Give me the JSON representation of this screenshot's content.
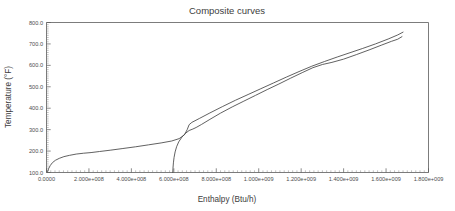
{
  "chart_data": {
    "type": "line",
    "title": "Composite curves",
    "xlabel": "Enthalpy (Btu/h)",
    "ylabel": "Temperature (°F)",
    "xlim": [
      0,
      1800000000
    ],
    "ylim": [
      100,
      800
    ],
    "grid": false,
    "legend": "none",
    "x_tick_labels": [
      "0.0000",
      "2.000e+008",
      "4.000e+008",
      "6.000e+008",
      "8.000e+008",
      "1.000e+009",
      "1.200e+009",
      "1.400e+009",
      "1.600e+009",
      "1.800e+009"
    ],
    "x_tick_values": [
      0,
      200000000,
      400000000,
      600000000,
      800000000,
      1000000000,
      1200000000,
      1400000000,
      1600000000,
      1800000000
    ],
    "y_tick_labels": [
      "100.0",
      "200.0",
      "300.0",
      "400.0",
      "500.0",
      "600.0",
      "700.0",
      "800.0"
    ],
    "y_tick_values": [
      100,
      200,
      300,
      400,
      500,
      600,
      700,
      800
    ],
    "x_minor_per_major": 10,
    "y_minor_per_major": 10,
    "series": [
      {
        "name": "hot composite curve",
        "color": "#444444",
        "points": [
          [
            5000000,
            103
          ],
          [
            10000000,
            118
          ],
          [
            18000000,
            133
          ],
          [
            28000000,
            146
          ],
          [
            42000000,
            157
          ],
          [
            60000000,
            166
          ],
          [
            82000000,
            174
          ],
          [
            108000000,
            180
          ],
          [
            140000000,
            186
          ],
          [
            175000000,
            190
          ],
          [
            210000000,
            193
          ],
          [
            250000000,
            198
          ],
          [
            300000000,
            204
          ],
          [
            360000000,
            212
          ],
          [
            420000000,
            220
          ],
          [
            480000000,
            229
          ],
          [
            540000000,
            238
          ],
          [
            590000000,
            247
          ],
          [
            625000000,
            258
          ],
          [
            650000000,
            276
          ],
          [
            663000000,
            300
          ],
          [
            672000000,
            323
          ],
          [
            685000000,
            334
          ],
          [
            720000000,
            352
          ],
          [
            770000000,
            378
          ],
          [
            830000000,
            408
          ],
          [
            890000000,
            437
          ],
          [
            950000000,
            464
          ],
          [
            1010000000,
            491
          ],
          [
            1070000000,
            518
          ],
          [
            1130000000,
            545
          ],
          [
            1190000000,
            571
          ],
          [
            1250000000,
            596
          ],
          [
            1310000000,
            618
          ],
          [
            1370000000,
            639
          ],
          [
            1430000000,
            659
          ],
          [
            1490000000,
            679
          ],
          [
            1550000000,
            700
          ],
          [
            1610000000,
            723
          ],
          [
            1655000000,
            742
          ],
          [
            1680000000,
            755
          ]
        ]
      },
      {
        "name": "cold composite curve",
        "color": "#444444",
        "points": [
          [
            595000000,
            100
          ],
          [
            596000000,
            120
          ],
          [
            598000000,
            145
          ],
          [
            601000000,
            170
          ],
          [
            606000000,
            196
          ],
          [
            613000000,
            220
          ],
          [
            623000000,
            243
          ],
          [
            638000000,
            265
          ],
          [
            655000000,
            283
          ],
          [
            672000000,
            296
          ],
          [
            690000000,
            303
          ],
          [
            705000000,
            310
          ],
          [
            730000000,
            324
          ],
          [
            770000000,
            348
          ],
          [
            820000000,
            377
          ],
          [
            875000000,
            406
          ],
          [
            930000000,
            433
          ],
          [
            985000000,
            460
          ],
          [
            1040000000,
            487
          ],
          [
            1095000000,
            513
          ],
          [
            1150000000,
            540
          ],
          [
            1205000000,
            566
          ],
          [
            1255000000,
            589
          ],
          [
            1300000000,
            604
          ],
          [
            1345000000,
            614
          ],
          [
            1400000000,
            629
          ],
          [
            1460000000,
            650
          ],
          [
            1520000000,
            672
          ],
          [
            1580000000,
            695
          ],
          [
            1625000000,
            712
          ],
          [
            1655000000,
            722
          ],
          [
            1675000000,
            734
          ]
        ]
      }
    ]
  }
}
